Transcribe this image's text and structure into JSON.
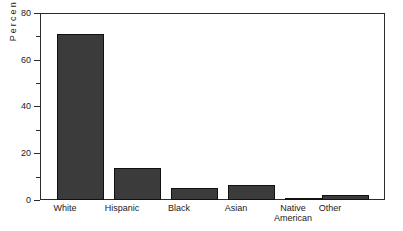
{
  "chart_data": {
    "type": "bar",
    "title": "",
    "xlabel": "",
    "ylabel": "Percent",
    "categories": [
      "White",
      "Hispanic",
      "Black",
      "Asian",
      "Native American",
      "Other"
    ],
    "values": [
      71,
      13.5,
      5,
      6.5,
      0.3,
      2
    ],
    "ylim": [
      0,
      80
    ],
    "ytick_labels": [
      "0",
      "20",
      "40",
      "60",
      "80"
    ],
    "ytick_values": [
      0,
      20,
      40,
      60,
      80
    ],
    "yminor_tick_values": [
      10,
      30,
      50,
      70
    ],
    "grid": false,
    "legend": null,
    "bar_color": "#3b3b3b",
    "bar_edge_color": "#111111",
    "axis_color": "#2b2b2b",
    "background_color": "#ffffff"
  },
  "axis": {
    "y_title": "Percent",
    "labels": {
      "y0": "0",
      "y20": "20",
      "y40": "40",
      "y60": "60",
      "y80": "80"
    },
    "x_labels": {
      "cat0": "White",
      "cat1": "Hispanic",
      "cat2": "Black",
      "cat3": "Asian",
      "cat4": "Native\nAmerican",
      "cat5": "Other"
    }
  }
}
